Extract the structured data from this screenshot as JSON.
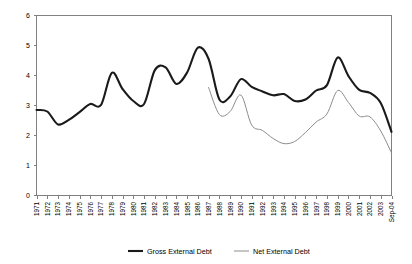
{
  "chart_data": {
    "type": "line",
    "title": "",
    "subtitle": "",
    "xlabel": "",
    "ylabel": "",
    "ylim": [
      0,
      6
    ],
    "yticks": [
      "0",
      "1",
      "2",
      "3",
      "4",
      "5",
      "6"
    ],
    "grid": false,
    "legend_position": "bottom",
    "categories": [
      "1971",
      "1972",
      "1973",
      "1974",
      "1975",
      "1976",
      "1977",
      "1978",
      "1979",
      "1980",
      "1981",
      "1982",
      "1983",
      "1984",
      "1985",
      "1986",
      "1987",
      "1988",
      "1989",
      "1990",
      "1991",
      "1992",
      "1993",
      "1994",
      "1995",
      "1996",
      "1997",
      "1998",
      "1999",
      "2000",
      "2001",
      "2002",
      "2003",
      "Sep-04"
    ],
    "series": [
      {
        "name": "Gross External Debt",
        "color": "#1a1a1a",
        "values": [
          2.85,
          2.8,
          2.37,
          2.52,
          2.78,
          3.05,
          3.02,
          4.09,
          3.55,
          3.15,
          3.05,
          4.18,
          4.27,
          3.72,
          4.1,
          4.93,
          4.55,
          3.2,
          3.3,
          3.88,
          3.62,
          3.47,
          3.34,
          3.38,
          3.15,
          3.2,
          3.5,
          3.68,
          4.6,
          3.98,
          3.52,
          3.42,
          3.08,
          2.12
        ]
      },
      {
        "name": "Net External Debt",
        "color": "#8c8c8c",
        "values": [
          null,
          null,
          null,
          null,
          null,
          null,
          null,
          null,
          null,
          null,
          null,
          null,
          null,
          null,
          null,
          null,
          3.6,
          2.7,
          2.8,
          3.35,
          2.35,
          2.17,
          1.9,
          1.73,
          1.8,
          2.1,
          2.45,
          2.72,
          3.5,
          3.1,
          2.65,
          2.62,
          2.15,
          1.42
        ]
      }
    ]
  },
  "legend": {
    "entries": [
      {
        "label": "Gross External Debt",
        "style": "thick-dark"
      },
      {
        "label": "Net External Debt",
        "style": "thin-gray"
      }
    ]
  },
  "axes": {
    "y_labels": [
      "6",
      "5",
      "4",
      "3",
      "2",
      "1",
      "0"
    ],
    "x_labels": [
      "1971",
      "1972",
      "1973",
      "1974",
      "1975",
      "1976",
      "1977",
      "1978",
      "1979",
      "1980",
      "1981",
      "1982",
      "1983",
      "1984",
      "1985",
      "1986",
      "1987",
      "1988",
      "1989",
      "1990",
      "1991",
      "1992",
      "1993",
      "1994",
      "1995",
      "1996",
      "1997",
      "1998",
      "1999",
      "2000",
      "2001",
      "2002",
      "2003",
      "Sep-04"
    ]
  }
}
